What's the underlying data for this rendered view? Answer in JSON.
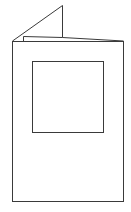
{
  "diagram": {
    "stroke_color": "#3a3a3a",
    "background": "#ffffff",
    "front_panel": {
      "x": 12,
      "y": 41,
      "width": 111,
      "height": 160
    },
    "aperture": {
      "x": 32,
      "y": 61,
      "width": 71,
      "height": 71
    },
    "back_flap": {
      "peak": [
        62,
        5
      ],
      "left": [
        12,
        41
      ],
      "fold_bottom": [
        62,
        37
      ]
    },
    "inner_edge": {
      "points": [
        [
          23,
          41
        ],
        [
          23,
          36
        ],
        [
          62,
          37
        ],
        [
          123,
          41
        ]
      ]
    }
  }
}
